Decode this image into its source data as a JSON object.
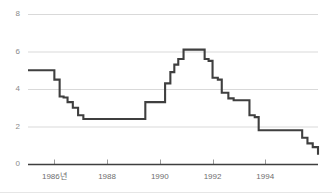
{
  "chart_data": {
    "type": "line",
    "title": "",
    "subtitle": "",
    "xlabel": "",
    "ylabel": "",
    "legend": [],
    "legend_position": "none",
    "grid": true,
    "grid_axis": "y",
    "line_style": "step",
    "line_color": "#3f3f3f",
    "grid_color": "#d9d9d9",
    "axis_color": "#3f3f3f",
    "tick_label_color": "#7f7f7f",
    "background_color": "#ffffff",
    "xlim": [
      1985.0,
      1996.0
    ],
    "ylim": [
      0,
      8
    ],
    "y_ticks": [
      0,
      2,
      4,
      6,
      8
    ],
    "y_tick_labels": [
      "0",
      "2",
      "4",
      "6",
      "8"
    ],
    "x_ticks": [
      1986,
      1988,
      1990,
      1992,
      1994
    ],
    "x_tick_labels": [
      "1986년",
      "1988",
      "1990",
      "1992",
      "1994"
    ],
    "x": [
      1985.0,
      1985.9,
      1986.0,
      1986.2,
      1986.35,
      1986.5,
      1986.7,
      1986.9,
      1987.1,
      1989.3,
      1989.45,
      1990.0,
      1990.2,
      1990.4,
      1990.55,
      1990.7,
      1990.9,
      1991.5,
      1991.7,
      1991.85,
      1992.0,
      1992.2,
      1992.35,
      1992.6,
      1992.8,
      1993.1,
      1993.4,
      1993.6,
      1993.75,
      1995.2,
      1995.4,
      1995.6,
      1995.8,
      1996.0
    ],
    "y": [
      5.0,
      5.0,
      4.5,
      3.6,
      3.55,
      3.3,
      3.0,
      2.6,
      2.4,
      2.4,
      3.3,
      3.3,
      4.3,
      4.9,
      5.3,
      5.6,
      6.1,
      6.1,
      5.6,
      5.5,
      4.6,
      4.5,
      3.8,
      3.5,
      3.4,
      3.4,
      2.6,
      2.5,
      1.8,
      1.8,
      1.4,
      1.1,
      0.9,
      0.5
    ],
    "series": [
      {
        "name": "rate",
        "values": [
          5.0,
          5.0,
          4.5,
          3.6,
          3.55,
          3.3,
          3.0,
          2.6,
          2.4,
          2.4,
          3.3,
          3.3,
          4.3,
          4.9,
          5.3,
          5.6,
          6.1,
          6.1,
          5.6,
          5.5,
          4.6,
          4.5,
          3.8,
          3.5,
          3.4,
          3.4,
          2.6,
          2.5,
          1.8,
          1.8,
          1.4,
          1.1,
          0.9,
          0.5
        ]
      }
    ],
    "annotations": [],
    "notes": {
      "start_value": 5.0,
      "trough_value": 2.4,
      "peak_value": 6.1,
      "end_value": 0.5
    }
  }
}
